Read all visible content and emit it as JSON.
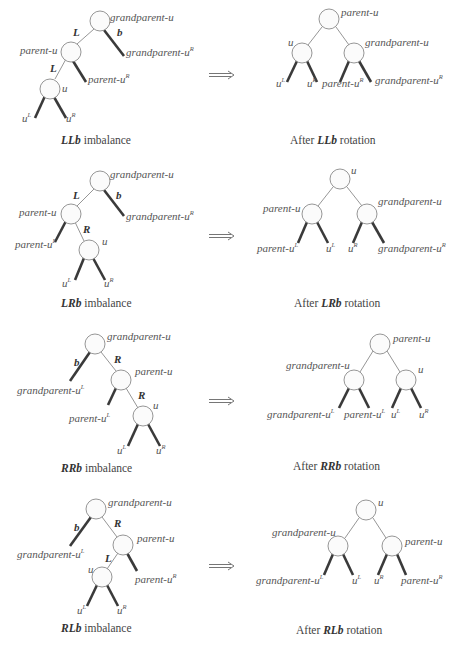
{
  "arrow_glyph": "⟹",
  "labels": {
    "grandparent_u": "grandparent-u",
    "parent_u": "parent-u",
    "u": "u",
    "grandparent_u_base": "grandparent-u",
    "parent_u_base": "parent-u",
    "u_base": "u",
    "sup_L": "L",
    "sup_R": "R",
    "edge_L": "L",
    "edge_R": "R",
    "edge_b": "b"
  },
  "panels": [
    {
      "case": "LLb",
      "before_caption_bold": "LLb",
      "before_caption_rest": " imbalance",
      "after_caption_prefix": "After ",
      "after_caption_bold": "LLb",
      "after_caption_rest": " rotation",
      "before": {
        "nodes": [
          "grandparent-u",
          "parent-u",
          "u"
        ],
        "edges": [
          "L",
          "L",
          "b"
        ],
        "subtrees": [
          "u^L",
          "u^R",
          "parent-u^R",
          "grandparent-u^R"
        ]
      },
      "after": {
        "root": "parent-u",
        "left": "u",
        "right": "grandparent-u",
        "subtrees": [
          "u^L",
          "u^R",
          "parent-u^R",
          "grandparent-u^R"
        ]
      }
    },
    {
      "case": "LRb",
      "before_caption_bold": "LRb",
      "before_caption_rest": " imbalance",
      "after_caption_prefix": "After ",
      "after_caption_bold": "LRb",
      "after_caption_rest": " rotation",
      "before": {
        "nodes": [
          "grandparent-u",
          "parent-u",
          "u"
        ],
        "edges": [
          "L",
          "R",
          "b"
        ],
        "subtrees": [
          "parent-u^L",
          "u^L",
          "u^R",
          "grandparent-u^R"
        ]
      },
      "after": {
        "root": "u",
        "left": "parent-u",
        "right": "grandparent-u",
        "subtrees": [
          "parent-u^L",
          "u^L",
          "u^R",
          "grandparent-u^R"
        ]
      }
    },
    {
      "case": "RRb",
      "before_caption_bold": "RRb",
      "before_caption_rest": " imbalance",
      "after_caption_prefix": "After ",
      "after_caption_bold": "RRb",
      "after_caption_rest": " rotation",
      "before": {
        "nodes": [
          "grandparent-u",
          "parent-u",
          "u"
        ],
        "edges": [
          "b",
          "R",
          "R"
        ],
        "subtrees": [
          "grandparent-u^L",
          "parent-u^L",
          "u^L",
          "u^R"
        ]
      },
      "after": {
        "root": "parent-u",
        "left": "grandparent-u",
        "right": "u",
        "subtrees": [
          "grandparent-u^L",
          "parent-u^L",
          "u^L",
          "u^R"
        ]
      }
    },
    {
      "case": "RLb",
      "before_caption_bold": "RLb",
      "before_caption_rest": " imbalance",
      "after_caption_prefix": "After ",
      "after_caption_bold": "RLb",
      "after_caption_rest": " rotation",
      "before": {
        "nodes": [
          "grandparent-u",
          "parent-u",
          "u"
        ],
        "edges": [
          "b",
          "R",
          "L"
        ],
        "subtrees": [
          "grandparent-u^L",
          "u^L",
          "u^R",
          "parent-u^R"
        ]
      },
      "after": {
        "root": "u",
        "left": "grandparent-u",
        "right": "parent-u",
        "subtrees": [
          "grandparent-u^L",
          "u^L",
          "u^R",
          "parent-u^R"
        ]
      }
    }
  ]
}
